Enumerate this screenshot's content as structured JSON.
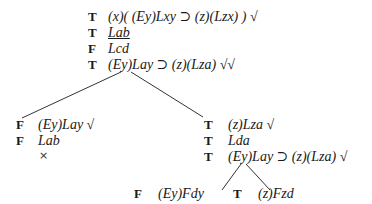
{
  "root": {
    "nodes": [
      {
        "sign": "T",
        "formula": "(x)( (Ey)Lxy ⊃ (z)(Lzx) ) √",
        "underline": false
      },
      {
        "sign": "T",
        "formula": "Lab",
        "underline": true
      },
      {
        "sign": "F",
        "formula": "Lcd",
        "underline": false
      },
      {
        "sign": "T",
        "formula": "(Ey)Lay ⊃ (z)(Lza) √√",
        "underline": false
      }
    ]
  },
  "left_branch": {
    "nodes": [
      {
        "sign": "F",
        "formula": "(Ey)Lay √"
      },
      {
        "sign": "F",
        "formula": "Lab"
      }
    ],
    "closed_mark": "×"
  },
  "right_branch": {
    "nodes": [
      {
        "sign": "T",
        "formula": "(z)Lza √"
      },
      {
        "sign": "T",
        "formula": "Lda"
      },
      {
        "sign": "T",
        "formula": "(Ey)Lay ⊃ (z)(Lza) √"
      }
    ]
  },
  "right_left_leaf": {
    "sign": "F",
    "formula": "(Ey)Fdy"
  },
  "right_right_leaf": {
    "sign": "T",
    "formula": "(z)Fzd"
  }
}
